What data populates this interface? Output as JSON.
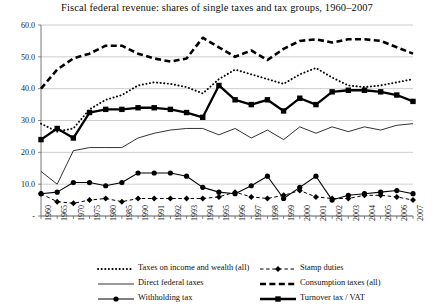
{
  "chart_data": {
    "type": "line",
    "title": "Fiscal federal revenue: shares of single taxes and tax groups, 1960–2007",
    "xlabel": "",
    "ylabel": "",
    "ylim": [
      0,
      60
    ],
    "yticks": [
      "-",
      "10.0",
      "20.0",
      "30.0",
      "40.0",
      "50.0",
      "60.0"
    ],
    "ytick_values": [
      0,
      10,
      20,
      30,
      40,
      50,
      60
    ],
    "grid": true,
    "legend_position": "bottom",
    "categories": [
      "1960",
      "1965",
      "1970",
      "1975",
      "1980",
      "1985",
      "1990",
      "1991",
      "1992",
      "1993",
      "1994",
      "1995",
      "1996",
      "1997",
      "1998",
      "1999",
      "2000",
      "2001",
      "2002",
      "2003",
      "2004",
      "2005",
      "2006",
      "2007"
    ],
    "x": [
      "1960",
      "1965",
      "1970",
      "1975",
      "1980",
      "1985",
      "1990",
      "1991",
      "1992",
      "1993",
      "1994",
      "1995",
      "1996",
      "1997",
      "1998",
      "1999",
      "2000",
      "2001",
      "2002",
      "2003",
      "2004",
      "2005",
      "2006",
      "2007"
    ],
    "series": [
      {
        "name": "Taxes on income and wealth (all)",
        "style": "dotted",
        "marker": "none",
        "color": "#000000",
        "values": [
          29.0,
          26.5,
          27.5,
          33.5,
          36.5,
          38.0,
          41.0,
          42.0,
          41.5,
          40.5,
          38.5,
          43.0,
          46.0,
          44.5,
          43.0,
          41.5,
          44.5,
          46.5,
          43.5,
          41.0,
          40.5,
          41.0,
          42.0,
          43.0
        ]
      },
      {
        "name": "Direct federal taxes",
        "style": "solid-thin",
        "marker": "none",
        "color": "#000000",
        "values": [
          14.0,
          10.0,
          20.5,
          21.5,
          21.5,
          21.5,
          24.5,
          26.0,
          27.0,
          27.5,
          27.5,
          25.5,
          27.5,
          24.5,
          27.0,
          24.0,
          28.0,
          26.0,
          28.0,
          26.5,
          28.0,
          27.0,
          28.5,
          29.0
        ]
      },
      {
        "name": "Withholding tax",
        "style": "solid",
        "marker": "circle",
        "color": "#000000",
        "values": [
          7.0,
          7.5,
          10.5,
          10.5,
          9.5,
          10.5,
          13.5,
          13.5,
          13.5,
          12.5,
          9.0,
          7.5,
          7.0,
          9.5,
          12.5,
          5.5,
          9.0,
          12.5,
          5.0,
          6.5,
          7.0,
          7.5,
          8.0,
          7.0
        ]
      },
      {
        "name": "Stamp duties",
        "style": "dashed-thin",
        "marker": "diamond",
        "color": "#000000",
        "values": [
          7.0,
          4.5,
          4.0,
          5.0,
          5.5,
          4.5,
          5.5,
          5.5,
          5.5,
          5.5,
          5.5,
          6.0,
          7.5,
          6.0,
          5.5,
          6.5,
          8.0,
          6.0,
          5.5,
          5.5,
          6.5,
          6.5,
          6.0,
          5.0
        ]
      },
      {
        "name": "Consumption taxes (all)",
        "style": "dashed-thick",
        "marker": "none",
        "color": "#000000",
        "values": [
          40.0,
          46.0,
          49.5,
          51.0,
          53.5,
          53.5,
          51.0,
          49.5,
          48.5,
          49.5,
          56.0,
          53.0,
          50.0,
          52.0,
          49.0,
          52.5,
          55.0,
          55.5,
          54.5,
          55.5,
          55.5,
          55.0,
          53.0,
          51.0
        ]
      },
      {
        "name": "Turnover tax / VAT",
        "style": "solid-thick",
        "marker": "square",
        "color": "#000000",
        "values": [
          24.0,
          27.5,
          24.5,
          32.5,
          33.5,
          33.5,
          34.0,
          34.0,
          33.5,
          32.5,
          31.0,
          41.0,
          36.5,
          35.0,
          36.5,
          33.0,
          37.0,
          35.0,
          39.0,
          39.5,
          39.5,
          39.0,
          38.0,
          36.0
        ]
      }
    ],
    "legend": [
      {
        "label": "Taxes on income and wealth (all)",
        "style": "dotted",
        "marker": "none"
      },
      {
        "label": "Direct federal taxes",
        "style": "solid-thin",
        "marker": "none"
      },
      {
        "label": "Withholding tax",
        "style": "solid",
        "marker": "circle"
      },
      {
        "label": "Stamp duties",
        "style": "dashed-thin",
        "marker": "diamond"
      },
      {
        "label": "Consumption taxes (all)",
        "style": "dashed-thick",
        "marker": "none"
      },
      {
        "label": "Turnover tax / VAT",
        "style": "solid-thick",
        "marker": "square"
      }
    ]
  }
}
